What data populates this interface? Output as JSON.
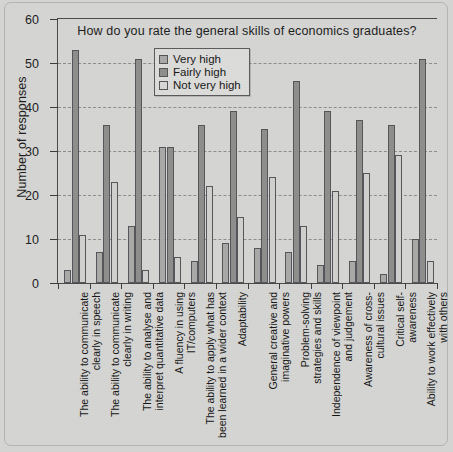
{
  "chart_data": {
    "type": "bar",
    "title": "How do you rate the general skills of economics graduates?",
    "xlabel": "",
    "ylabel": "Number of responses",
    "ylim": [
      0,
      60
    ],
    "yticks": [
      0,
      10,
      20,
      30,
      40,
      50,
      60
    ],
    "grid": true,
    "legend_position": "top-center-inside",
    "categories": [
      "The ability to communicate\nclearly in speech",
      "The ability to communicate\nclearly in writing",
      "The ability to analyse and\ninterpret quantitative data",
      "A fluency in using\nIT/computers",
      "The ability to apply what has\nbeen learned in a wider context",
      "Adaptability",
      "General creative and\nimaginative powers",
      "Problem-solving\nstrategies and skills",
      "Independence of viewpoint\nand judgement",
      "Awareness of cross-\ncultural issues",
      "Critical self-\nawareness",
      "Ability to work effectively\nwith others"
    ],
    "series": [
      {
        "name": "Very high",
        "color": "#a9a9a7",
        "values": [
          3,
          7,
          13,
          31,
          5,
          9,
          8,
          7,
          4,
          5,
          2,
          10
        ]
      },
      {
        "name": "Fairly high",
        "color": "#8e8e8c",
        "values": [
          53,
          36,
          51,
          31,
          36,
          39,
          35,
          46,
          39,
          37,
          36,
          51
        ]
      },
      {
        "name": "Not very high",
        "color": "#d7d7d5",
        "values": [
          11,
          23,
          3,
          6,
          22,
          15,
          24,
          13,
          21,
          25,
          29,
          5
        ]
      }
    ]
  }
}
